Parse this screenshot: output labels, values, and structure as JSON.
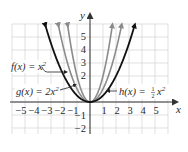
{
  "chart_data": {
    "type": "line",
    "title": "",
    "xlabel": "x",
    "ylabel": "y",
    "xlim": [
      -6,
      6.3
    ],
    "ylim": [
      -2.5,
      6.5
    ],
    "grid": true,
    "x_ticks": [
      "−5",
      "−4",
      "−3",
      "−2",
      "−1",
      "1",
      "2",
      "3",
      "4",
      "5"
    ],
    "y_ticks": [
      "5",
      "4",
      "3",
      "2",
      "−1",
      "−2"
    ],
    "series": [
      {
        "name": "f(x) = x²",
        "coefficient": 1,
        "color": "#8a8a8a",
        "x": [
          -2.45,
          -2,
          -1,
          0,
          1,
          2,
          2.45
        ],
        "values": [
          6,
          4,
          1,
          0,
          1,
          4,
          6
        ]
      },
      {
        "name": "g(x) = 2x²",
        "coefficient": 2,
        "color": "#8a8a8a",
        "x": [
          -1.73,
          -1,
          0,
          1,
          1.73
        ],
        "values": [
          6,
          2,
          0,
          2,
          6
        ]
      },
      {
        "name": "h(x) = ½x²",
        "coefficient": 0.5,
        "color": "#111111",
        "x": [
          -3.46,
          -2,
          0,
          2,
          3.46
        ],
        "values": [
          6,
          2,
          0,
          2,
          6
        ]
      }
    ],
    "annotations": [
      {
        "text_main": "f(x) = x",
        "sup": "2",
        "points_to": "middle gray parabola"
      },
      {
        "text_main": "g(x) = 2x",
        "sup": "2",
        "points_to": "inner gray parabola"
      },
      {
        "text_main": "h(x) = ",
        "frac_num": "1",
        "frac_den": "2",
        "text_tail": "x",
        "sup": "2",
        "points_to": "black parabola"
      }
    ],
    "colors": {
      "grid": "#cfcfcf",
      "axis": "#333333",
      "gray_curve": "#8a8a8a",
      "black_curve": "#111111"
    }
  }
}
